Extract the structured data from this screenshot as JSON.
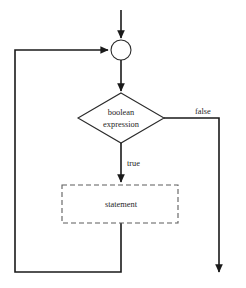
{
  "diagram": {
    "background_color": "#ffffff",
    "line_color": "#1a1a1a",
    "text_color": "#262626",
    "dashed_border_color": "#5d5d5d",
    "nodes": {
      "entry_arrow": {
        "icon": "arrow-down-icon",
        "label": ""
      },
      "merge_point": {
        "shape": "circle",
        "label": "",
        "cx": 121,
        "cy": 50,
        "r": 10
      },
      "condition": {
        "shape": "diamond",
        "line1": "boolean",
        "line2": "expression",
        "cx": 121,
        "cy": 118,
        "half_width": 43,
        "half_height": 25
      },
      "body": {
        "shape": "dashed-rectangle",
        "label": "statement",
        "x": 62,
        "y": 185,
        "width": 116,
        "height": 38
      },
      "exit_arrow": {
        "icon": "arrow-down-icon",
        "label": ""
      }
    },
    "edge_labels": {
      "false_branch": "false",
      "true_branch": "true"
    },
    "edges": [
      {
        "name": "entry-to-merge",
        "from": "entry",
        "to": "merge_point",
        "arrow": true
      },
      {
        "name": "merge-to-condition",
        "from": "merge_point",
        "to": "condition",
        "arrow": true
      },
      {
        "name": "condition-false-to-exit",
        "from": "condition",
        "to": "exit",
        "label": "false",
        "arrow": true
      },
      {
        "name": "condition-true-to-body",
        "from": "condition",
        "to": "body",
        "label": "true",
        "arrow": true
      },
      {
        "name": "body-back-to-merge",
        "from": "body",
        "to": "merge_point",
        "arrow": true
      }
    ]
  }
}
